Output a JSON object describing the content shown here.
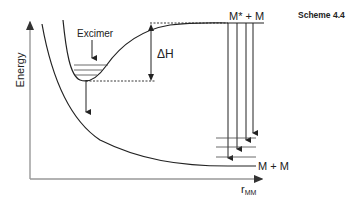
{
  "scheme_label": "Scheme 4.4",
  "axes": {
    "y_label": "Energy",
    "x_label_main": "r",
    "x_label_sub": "MM"
  },
  "labels": {
    "excimer": "Excimer",
    "delta_h": "ΔH",
    "upper_asymptote": "M* + M",
    "lower_asymptote": "M + M"
  },
  "colors": {
    "line": "#222222",
    "axis": "#999999"
  }
}
